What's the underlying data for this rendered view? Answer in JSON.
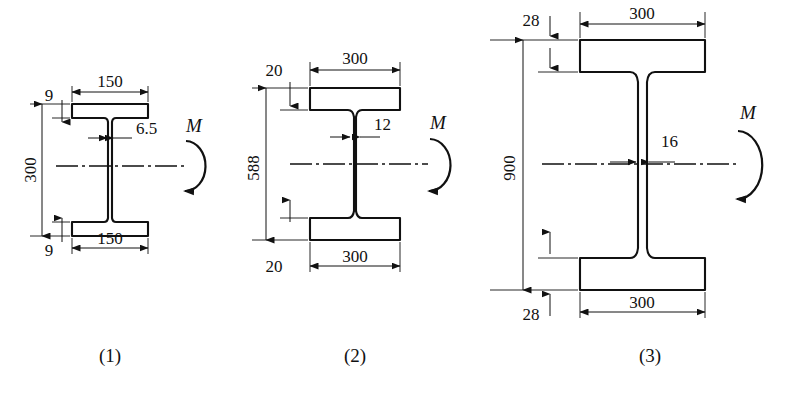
{
  "figure": {
    "background_color": "#ffffff",
    "line_color": "#111111"
  },
  "sections": [
    {
      "id": "section-1",
      "caption": "(1)",
      "moment_label": "M",
      "moment_direction": "counterclockwise",
      "dimensions": {
        "total_height": "300",
        "top_flange_width": "150",
        "bottom_flange_width": "150",
        "top_flange_thickness": "9",
        "bottom_flange_thickness": "9",
        "web_thickness": "6.5"
      }
    },
    {
      "id": "section-2",
      "caption": "(2)",
      "moment_label": "M",
      "moment_direction": "counterclockwise",
      "dimensions": {
        "total_height": "588",
        "top_flange_width": "300",
        "bottom_flange_width": "300",
        "top_flange_thickness": "20",
        "bottom_flange_thickness": "20",
        "web_thickness": "12"
      }
    },
    {
      "id": "section-3",
      "caption": "(3)",
      "moment_label": "M",
      "moment_direction": "counterclockwise",
      "dimensions": {
        "total_height": "900",
        "top_flange_width": "300",
        "bottom_flange_width": "300",
        "top_flange_thickness": "28",
        "bottom_flange_thickness": "28",
        "web_thickness": "16"
      }
    }
  ]
}
